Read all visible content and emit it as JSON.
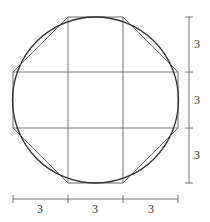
{
  "diagram": {
    "colors": {
      "stroke": "#3a3a3a",
      "grid": "#555555",
      "background": "#ffffff"
    },
    "square": {
      "x0": 13,
      "y0": 17,
      "x1": 178,
      "y1": 183
    },
    "grid_lines": {
      "x": [
        68,
        123
      ],
      "y": [
        72,
        128
      ]
    },
    "circle": {
      "cx": 95.5,
      "cy": 100,
      "r": 83
    },
    "octagon_points": "68,17 123,17 178,72 178,128 123,183 68,183 13,128 13,72",
    "dimension_vertical": {
      "x": 189,
      "y0": 17,
      "y1": 183,
      "ticks": [
        17,
        72,
        128,
        183
      ],
      "labels": [
        {
          "text": "3",
          "x": 197,
          "y": 48
        },
        {
          "text": "3",
          "x": 197,
          "y": 104
        },
        {
          "text": "3",
          "x": 197,
          "y": 159
        }
      ]
    },
    "dimension_horizontal": {
      "y": 199,
      "x0": 13,
      "x1": 178,
      "ticks": [
        13,
        68,
        123,
        178
      ],
      "labels": [
        {
          "text": "3",
          "x": 40,
          "y": 213
        },
        {
          "text": "3",
          "x": 95,
          "y": 213
        },
        {
          "text": "3",
          "x": 151,
          "y": 213
        }
      ]
    }
  }
}
